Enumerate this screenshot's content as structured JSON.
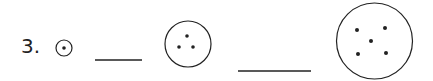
{
  "problem": {
    "number_label": "3.",
    "sequence": [
      {
        "type": "circle",
        "dots": 1
      },
      {
        "type": "blank"
      },
      {
        "type": "circle",
        "dots": 3
      },
      {
        "type": "blank"
      },
      {
        "type": "circle",
        "dots": 5
      }
    ]
  },
  "colors": {
    "ink": "#222222",
    "background": "#ffffff"
  }
}
